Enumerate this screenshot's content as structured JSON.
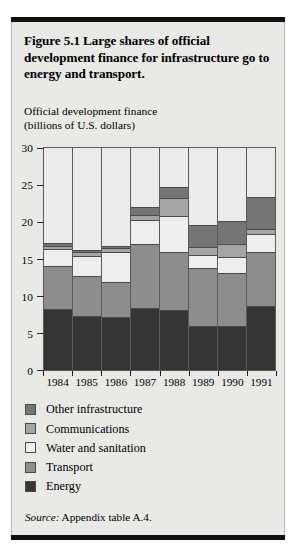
{
  "figure": {
    "title": "Figure 5.1  Large shares of official development finance for infrastructure go to energy and transport.",
    "source_prefix": "Source:",
    "source_text": "Appendix table A.4.",
    "axis_title_line1": "Official development finance",
    "axis_title_line2": "(billions of U.S. dollars)"
  },
  "chart_data": {
    "type": "bar",
    "subtype": "stacked-vertical",
    "title": "Figure 5.1  Large shares of official development finance for infrastructure go to energy and transport.",
    "xlabel": "",
    "ylabel": "Official development finance (billions of U.S. dollars)",
    "ylim": [
      0,
      30
    ],
    "yticks": [
      0,
      5,
      10,
      15,
      20,
      25,
      30
    ],
    "ytick_labels": [
      "0",
      "5",
      "10",
      "15",
      "20",
      "25",
      "30"
    ],
    "grid": false,
    "legend_position": "below-plot",
    "categories": [
      "1984",
      "1985",
      "1986",
      "1987",
      "1988",
      "1989",
      "1990",
      "1991"
    ],
    "stack_order_bottom_to_top": [
      "Energy",
      "Transport",
      "Water and sanitation",
      "Communications",
      "Other infrastructure"
    ],
    "series": [
      {
        "name": "Energy",
        "color": "#353535",
        "values": [
          8.2,
          7.3,
          7.2,
          8.4,
          8.1,
          6.0,
          5.9,
          8.7
        ]
      },
      {
        "name": "Transport",
        "color": "#8d8d8d",
        "values": [
          5.8,
          5.4,
          4.7,
          8.6,
          7.9,
          7.8,
          7.2,
          7.2
        ]
      },
      {
        "name": "Water and sanitation",
        "color": "#eeeeee",
        "values": [
          2.3,
          2.7,
          4.0,
          3.3,
          4.8,
          1.7,
          2.2,
          2.5
        ]
      },
      {
        "name": "Communications",
        "color": "#a5a5a5",
        "values": [
          0.5,
          0.5,
          0.6,
          0.6,
          2.4,
          1.1,
          1.7,
          0.7
        ]
      },
      {
        "name": "Other infrastructure",
        "color": "#757575",
        "values": [
          0.4,
          0.3,
          0.2,
          1.1,
          1.6,
          3.0,
          3.2,
          4.3
        ]
      }
    ],
    "totals": [
      17.2,
      16.2,
      16.7,
      22.0,
      24.8,
      19.6,
      20.2,
      23.4
    ]
  },
  "legend": {
    "items": [
      {
        "label": "Other infrastructure",
        "color": "#757575"
      },
      {
        "label": "Communications",
        "color": "#a5a5a5"
      },
      {
        "label": "Water and sanitation",
        "color": "#eeeeee"
      },
      {
        "label": "Transport",
        "color": "#8d8d8d"
      },
      {
        "label": "Energy",
        "color": "#353535"
      }
    ]
  },
  "colors": {
    "panel_background": "#e9e9e6",
    "plot_background": "#ececec",
    "rule": "#111111",
    "axis": "#5a5a5a"
  }
}
